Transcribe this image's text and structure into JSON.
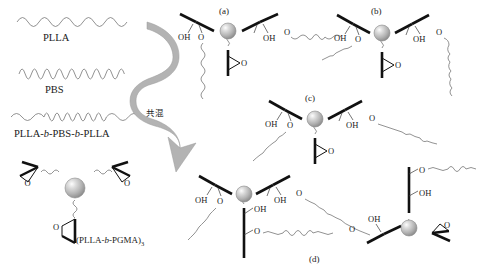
{
  "figure": {
    "background": "#ffffff",
    "line_color": "#111111",
    "chain_color": "#6e6e6e",
    "sphere_color": "#b9b9b9",
    "arrow_color": "#b3b3b3"
  },
  "legend": {
    "items": [
      {
        "id": "plla",
        "label": "PLLA",
        "wave": "long",
        "note": "smooth long-wavelength wave"
      },
      {
        "id": "pbs",
        "label": "PBS",
        "wave": "tight",
        "note": "high-frequency tight wave"
      },
      {
        "id": "triblock",
        "label_parts": [
          {
            "text": "PLLA-",
            "italic": false
          },
          {
            "text": "b",
            "italic": true
          },
          {
            "text": "-PBS-",
            "italic": false
          },
          {
            "text": "b",
            "italic": true
          },
          {
            "text": "-PLLA",
            "italic": false
          }
        ],
        "label": "PLLA-b-PBS-b-PLLA",
        "wave": "long-tight-long"
      }
    ]
  },
  "star_polymer": {
    "label_parts": [
      {
        "text": "(PLLA-",
        "italic": false
      },
      {
        "text": "b",
        "italic": true
      },
      {
        "text": "-PGMA)",
        "italic": false
      }
    ],
    "subscript": "3",
    "label": "(PLLA-b-PGMA)3",
    "arms": 3,
    "arm_terminus": "epoxide",
    "atom_label": "O"
  },
  "arrow": {
    "text": "共混",
    "meaning_label": "共混",
    "direction": "right"
  },
  "panels": [
    {
      "id": "a",
      "label": "(a)",
      "opened_arms": 2,
      "epoxide_arms": 1,
      "atom_labels": [
        "OH",
        "O",
        "OH",
        "O",
        "O"
      ]
    },
    {
      "id": "b",
      "label": "(b)",
      "opened_arms": 2,
      "epoxide_arms": 1,
      "atom_labels": [
        "OH",
        "O",
        "OH",
        "O",
        "O"
      ]
    },
    {
      "id": "c",
      "label": "(c)",
      "opened_arms": 2,
      "epoxide_arms": 1,
      "atom_labels": [
        "OH",
        "O",
        "OH",
        "O",
        "O"
      ]
    },
    {
      "id": "d",
      "label": "(d)",
      "opened_arms": 3,
      "epoxide_arms": 0,
      "atom_labels": [
        "OH",
        "O",
        "OH",
        "O",
        "OH",
        "O"
      ]
    }
  ],
  "atoms": {
    "hydroxyl": "OH",
    "oxygen": "O"
  }
}
